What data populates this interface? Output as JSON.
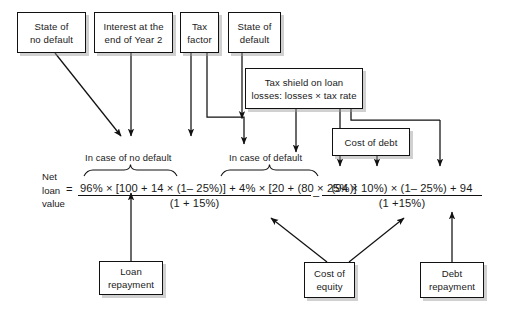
{
  "diagram": {
    "line_color": "#111111",
    "box_fill": "#ffffff",
    "shadow_color": "#969696"
  },
  "top_boxes": [
    {
      "id": "state-of-no-default",
      "line1": "State of",
      "line2": "no default"
    },
    {
      "id": "interest-end-year-2",
      "line1": "Interest at the",
      "line2": "end of Year 2"
    },
    {
      "id": "tax-factor",
      "line1": "Tax",
      "line2": "factor"
    },
    {
      "id": "state-of-default",
      "line1": "State of",
      "line2": "default"
    }
  ],
  "tax_shield_box": {
    "id": "tax-shield-on-loan-losses",
    "line1": "Tax shield on loan",
    "line2": "losses: losses × tax rate"
  },
  "cost_of_debt_box": {
    "id": "cost-of-debt",
    "line1": "Cost of debt"
  },
  "bottom_boxes": [
    {
      "id": "loan-repayment",
      "line1": "Loan",
      "line2": "repayment"
    },
    {
      "id": "cost-of-equity",
      "line1": "Cost of",
      "line2": "equity"
    },
    {
      "id": "debt-repayment",
      "line1": "Debt",
      "line2": "repayment"
    }
  ],
  "captions": {
    "no_default": "In case of no default",
    "default": "In case of default"
  },
  "formula": {
    "label_line1": "Net",
    "label_line2": "loan",
    "label_line3": "value",
    "equals": "=",
    "term1_numerator": "96% × [100 + 14 × (1– 25%)] + 4% × [20 + (80 × 25%)]",
    "term1_denominator": "(1 + 15%)",
    "minus": "–",
    "term2_numerator": "(94 × 10%) × (1– 25%) + 94",
    "term2_denominator": "(1 +15%)"
  }
}
